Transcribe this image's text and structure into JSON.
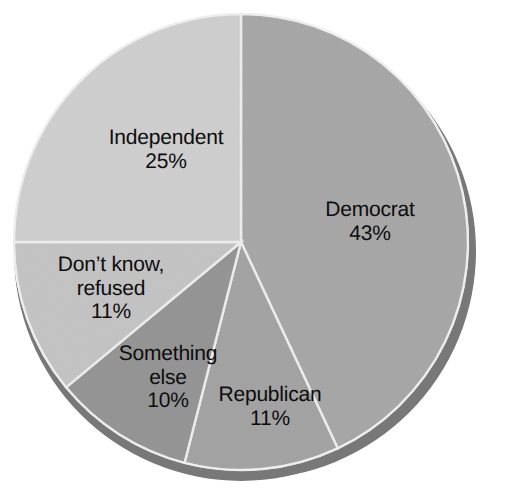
{
  "chart_data": {
    "type": "pie",
    "title": "",
    "subtitle": "",
    "xlabel": "",
    "ylabel": "",
    "legend": "none",
    "grid": false,
    "value_suffix": "%",
    "start_angle_deg": -90,
    "direction": "clockwise",
    "style": "3d-shaded-grayscale",
    "categories": [
      "Democrat",
      "Republican",
      "Something else",
      "Don't know, refused",
      "Independent"
    ],
    "values": [
      43,
      11,
      10,
      11,
      25
    ],
    "slices": [
      {
        "label": "Democrat",
        "value": 43,
        "value_text": "43%",
        "color": "#a9a9a9",
        "side_color": "#7d7d7d",
        "start_deg": -90,
        "end_deg": 64.8
      },
      {
        "label": "Republican",
        "value": 11,
        "value_text": "11%",
        "color": "#a5a5a5",
        "side_color": "#7a7a7a",
        "start_deg": 64.8,
        "end_deg": 104.4
      },
      {
        "label": "Something",
        "label_line2": "else",
        "value": 10,
        "value_text": "10%",
        "color": "#969696",
        "side_color": "#6e6e6e",
        "start_deg": 104.4,
        "end_deg": 140.4
      },
      {
        "label": "Don't know,",
        "label_line2": "refused",
        "value": 11,
        "value_text": "11%",
        "color": "#c6c6c6",
        "side_color": "#8f8f8f",
        "start_deg": 140.4,
        "end_deg": 180
      },
      {
        "label": "Independent",
        "value": 25,
        "value_text": "25%",
        "color": "#d2d2d2",
        "side_color": "#9a9a9a",
        "start_deg": 180,
        "end_deg": 270
      }
    ]
  },
  "labels": {
    "democrat": {
      "name": "Democrat",
      "value": "43%"
    },
    "republican": {
      "name": "Republican",
      "value": "11%"
    },
    "something_else": {
      "name": "Something",
      "name2": "else",
      "value": "10%"
    },
    "dont_know": {
      "name": "Don’t know,",
      "name2": "refused",
      "value": "11%"
    },
    "independent": {
      "name": "Independent",
      "value": "25%"
    }
  },
  "colors": {
    "background": "#ffffff",
    "separator": "#f2f2f2",
    "text": "#0d0d0d",
    "democrat": "#a9a9a9",
    "republican": "#a5a5a5",
    "something_else": "#969696",
    "dont_know": "#c6c6c6",
    "independent": "#d2d2d2",
    "depth_shadow": "#787878"
  }
}
